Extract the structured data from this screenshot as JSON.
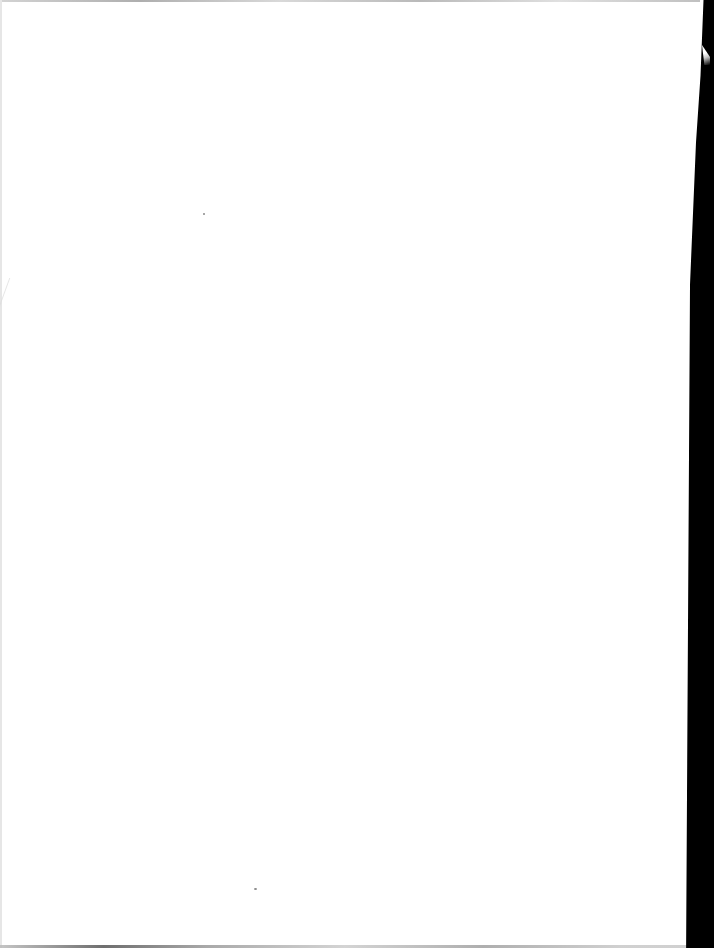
{
  "document": {
    "type": "scanned-page",
    "content": "",
    "is_blank": true
  },
  "colors": {
    "paper": "#ffffff",
    "scanner_border": "#000000",
    "edge_shadow": "#9a9a9a"
  },
  "artifacts": {
    "right_border": "black scanner margin",
    "top_edge": "thin gray paper edge",
    "bottom_edge": "thin gray paper edge",
    "left_fold": "faint diagonal fold mark",
    "specks": [
      {
        "x": 203,
        "y": 213
      },
      {
        "x": 254,
        "y": 888
      }
    ]
  }
}
